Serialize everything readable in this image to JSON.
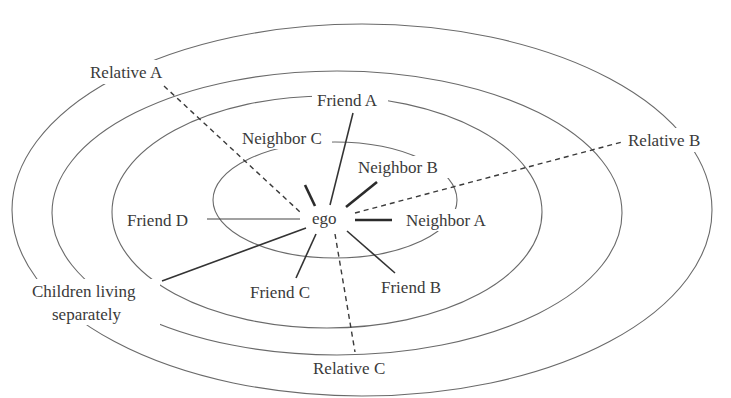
{
  "diagram": {
    "type": "ego-network-concentric",
    "center_label": "ego",
    "rings": [
      {
        "id": "ring-1",
        "cx": 335,
        "cy": 200,
        "rx": 122,
        "ry": 58
      },
      {
        "id": "ring-2",
        "cx": 327,
        "cy": 212,
        "rx": 215,
        "ry": 116
      },
      {
        "id": "ring-3",
        "cx": 337,
        "cy": 213,
        "rx": 285,
        "ry": 142
      },
      {
        "id": "ring-4",
        "cx": 362,
        "cy": 210,
        "rx": 350,
        "ry": 186
      }
    ],
    "nodes": [
      {
        "id": "friend-a",
        "label": "Friend A",
        "x": 318,
        "y": 107,
        "tie": "medium"
      },
      {
        "id": "neighbor-c",
        "label": "Neighbor C",
        "x": 242,
        "y": 144,
        "tie": "strong"
      },
      {
        "id": "neighbor-b",
        "label": "Neighbor B",
        "x": 358,
        "y": 174,
        "tie": "strong"
      },
      {
        "id": "neighbor-a",
        "label": "Neighbor A",
        "x": 406,
        "y": 227,
        "tie": "strong"
      },
      {
        "id": "friend-d",
        "label": "Friend D",
        "x": 127,
        "y": 226,
        "tie": "thin"
      },
      {
        "id": "friend-c",
        "label": "Friend C",
        "x": 250,
        "y": 299,
        "tie": "medium"
      },
      {
        "id": "friend-b",
        "label": "Friend B",
        "x": 381,
        "y": 294,
        "tie": "medium"
      },
      {
        "id": "children",
        "label_line1": "Children living",
        "label_line2": "separately",
        "x": 32,
        "y": 297,
        "tie": "medium"
      },
      {
        "id": "relative-a",
        "label": "Relative A",
        "x": 90,
        "y": 78,
        "tie": "weak"
      },
      {
        "id": "relative-b",
        "label": "Relative B",
        "x": 628,
        "y": 146,
        "tie": "weak"
      },
      {
        "id": "relative-c",
        "label": "Relative C",
        "x": 313,
        "y": 374,
        "tie": "weak"
      }
    ],
    "legend": {
      "thick_line": "strong tie",
      "thin_line": "tie",
      "dashed_line": "weak tie"
    }
  }
}
